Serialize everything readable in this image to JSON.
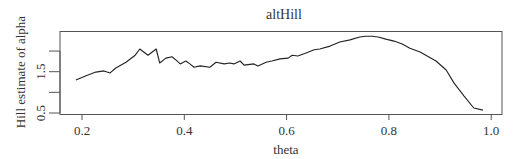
{
  "chart_data": {
    "type": "line",
    "title": "altHill",
    "xlabel": "theta",
    "ylabel": "Hill estimate of alpha",
    "xlim": [
      0.157,
      1.021
    ],
    "ylim": [
      0.48,
      2.49
    ],
    "xticks": [
      0.2,
      0.4,
      0.6,
      0.8,
      1.0
    ],
    "xtick_labels": [
      "0.2",
      "0.4",
      "0.6",
      "0.8",
      "1.0"
    ],
    "yticks": [
      0.5,
      1.0,
      1.5,
      2.0
    ],
    "ytick_labels": [
      "0.5",
      "",
      "1.5",
      ""
    ],
    "grid": false,
    "legend": null,
    "series": [
      {
        "name": "altHill",
        "color": "#222222",
        "x": [
          0.188,
          0.208,
          0.227,
          0.243,
          0.255,
          0.266,
          0.286,
          0.304,
          0.313,
          0.329,
          0.345,
          0.352,
          0.364,
          0.376,
          0.384,
          0.392,
          0.403,
          0.411,
          0.419,
          0.431,
          0.45,
          0.462,
          0.478,
          0.489,
          0.497,
          0.509,
          0.517,
          0.536,
          0.544,
          0.56,
          0.571,
          0.587,
          0.603,
          0.611,
          0.622,
          0.638,
          0.654,
          0.665,
          0.685,
          0.704,
          0.724,
          0.743,
          0.755,
          0.767,
          0.779,
          0.794,
          0.81,
          0.826,
          0.841,
          0.861,
          0.892,
          0.912,
          0.927,
          0.947,
          0.966,
          0.984
        ],
        "y": [
          1.3,
          1.4,
          1.49,
          1.52,
          1.47,
          1.59,
          1.73,
          1.9,
          2.05,
          1.9,
          2.05,
          1.71,
          1.83,
          1.86,
          1.78,
          1.69,
          1.76,
          1.69,
          1.61,
          1.64,
          1.61,
          1.73,
          1.69,
          1.71,
          1.69,
          1.76,
          1.66,
          1.69,
          1.64,
          1.73,
          1.76,
          1.81,
          1.83,
          1.9,
          1.88,
          1.95,
          2.03,
          2.05,
          2.12,
          2.22,
          2.27,
          2.34,
          2.36,
          2.36,
          2.34,
          2.29,
          2.24,
          2.17,
          2.07,
          1.98,
          1.76,
          1.54,
          1.23,
          0.91,
          0.62,
          0.57
        ]
      }
    ]
  }
}
